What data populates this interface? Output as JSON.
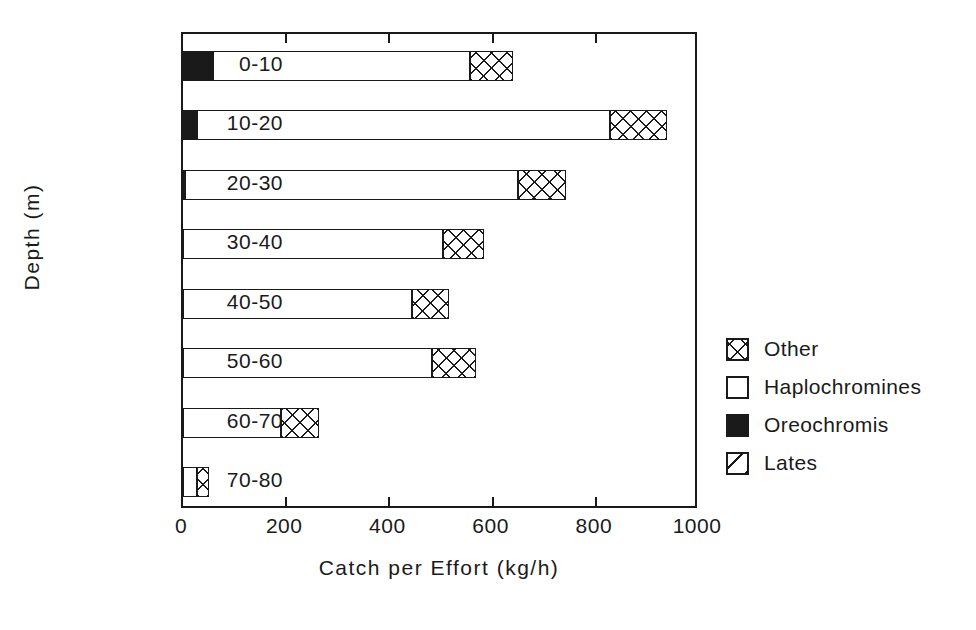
{
  "chart_data": {
    "type": "bar",
    "orientation": "horizontal",
    "stacked": true,
    "title": "",
    "xlabel": "Catch per Effort (kg/h)",
    "ylabel": "Depth (m)",
    "xlim": [
      0,
      1000
    ],
    "xticks": [
      0,
      200,
      400,
      600,
      800,
      1000
    ],
    "xticklabels": [
      "0",
      "200",
      "400",
      "600",
      "800",
      "1000"
    ],
    "grid": false,
    "legend_position": "right",
    "categories": [
      "0-10",
      "10-20",
      "20-30",
      "30-40",
      "40-50",
      "50-60",
      "60-70",
      "70-80"
    ],
    "series": [
      {
        "name": "Lates",
        "pattern": "diagonal-hatch",
        "values": [
          0,
          0,
          0,
          0,
          0,
          0,
          0,
          0
        ]
      },
      {
        "name": "Oreochromis",
        "pattern": "solid-black",
        "values": [
          58,
          28,
          4,
          0,
          0,
          0,
          0,
          0
        ]
      },
      {
        "name": "Haplochromines",
        "pattern": "white",
        "values": [
          499,
          800,
          646,
          504,
          444,
          483,
          190,
          28
        ]
      },
      {
        "name": "Other",
        "pattern": "crosshatch",
        "values": [
          83,
          110,
          92,
          80,
          71,
          84,
          74,
          22
        ]
      }
    ],
    "totals": [
      640,
      938,
      742,
      584,
      515,
      567,
      264,
      50
    ]
  },
  "legend": {
    "items": [
      {
        "label": "Other",
        "pattern": "crosshatch"
      },
      {
        "label": "Haplochromines",
        "pattern": "white"
      },
      {
        "label": "Oreochromis",
        "pattern": "solid-black"
      },
      {
        "label": "Lates",
        "pattern": "diagonal-hatch"
      }
    ]
  },
  "colors": {
    "ink": "#1a1a1a",
    "background": "#ffffff"
  }
}
